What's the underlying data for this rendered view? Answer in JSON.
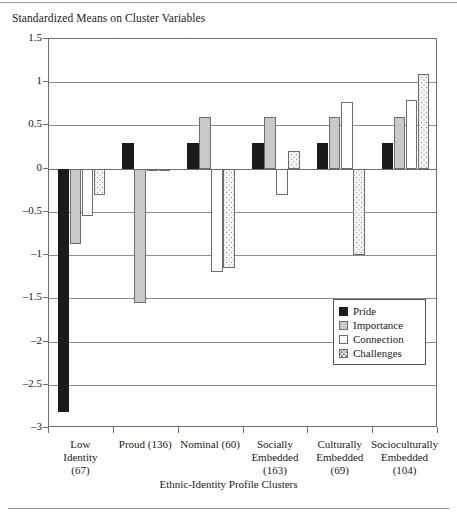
{
  "chart_data": {
    "type": "bar",
    "title": "Standardized Means on Cluster Variables",
    "xlabel": "Ethnic-Identity Profile Clusters",
    "ylabel": "",
    "ylim": [
      -3,
      1.5
    ],
    "yticks": [
      1.5,
      1,
      0.5,
      0,
      -0.5,
      -1,
      -1.5,
      -2,
      -2.5,
      -3
    ],
    "ytick_labels": [
      "1.5",
      "1",
      "0.5",
      "0",
      "–0.5",
      "–1",
      "–1.5",
      "–2",
      "–2.5",
      "–3"
    ],
    "grid": true,
    "legend_position": "inside-right",
    "categories": [
      "Low Identity (67)",
      "Proud (136)",
      "Nominal (60)",
      "Socially Embedded (163)",
      "Culturally Embedded (69)",
      "Socioculturally Embedded (104)"
    ],
    "category_lines": [
      [
        "Low",
        "Identity",
        "(67)"
      ],
      [
        "Proud (136)"
      ],
      [
        "Nominal (60)"
      ],
      [
        "Socially",
        "Embedded",
        "(163)"
      ],
      [
        "Culturally",
        "Embedded",
        "(69)"
      ],
      [
        "Socioculturally",
        "Embedded",
        "(104)"
      ]
    ],
    "series": [
      {
        "name": "Pride",
        "key": "pride",
        "color": "#1b1b1b",
        "values": [
          -2.82,
          0.3,
          0.3,
          0.3,
          0.3,
          0.3
        ]
      },
      {
        "name": "Importance",
        "key": "importance",
        "color": "#c9c9c9",
        "values": [
          -0.87,
          -1.55,
          0.6,
          0.6,
          0.6,
          0.6
        ]
      },
      {
        "name": "Connection",
        "key": "connection",
        "color": "#ffffff",
        "values": [
          -0.55,
          0.0,
          -1.2,
          -0.3,
          0.77,
          0.8
        ]
      },
      {
        "name": "Challenges",
        "key": "challenges",
        "color": "#f4f4f4",
        "values": [
          -0.3,
          0.0,
          -1.15,
          0.21,
          -1.0,
          1.1
        ]
      }
    ]
  },
  "legend": {
    "items": [
      {
        "label": "Pride",
        "key": "pride"
      },
      {
        "label": "Importance",
        "key": "importance"
      },
      {
        "label": "Connection",
        "key": "connection"
      },
      {
        "label": "Challenges",
        "key": "challenges"
      }
    ]
  }
}
